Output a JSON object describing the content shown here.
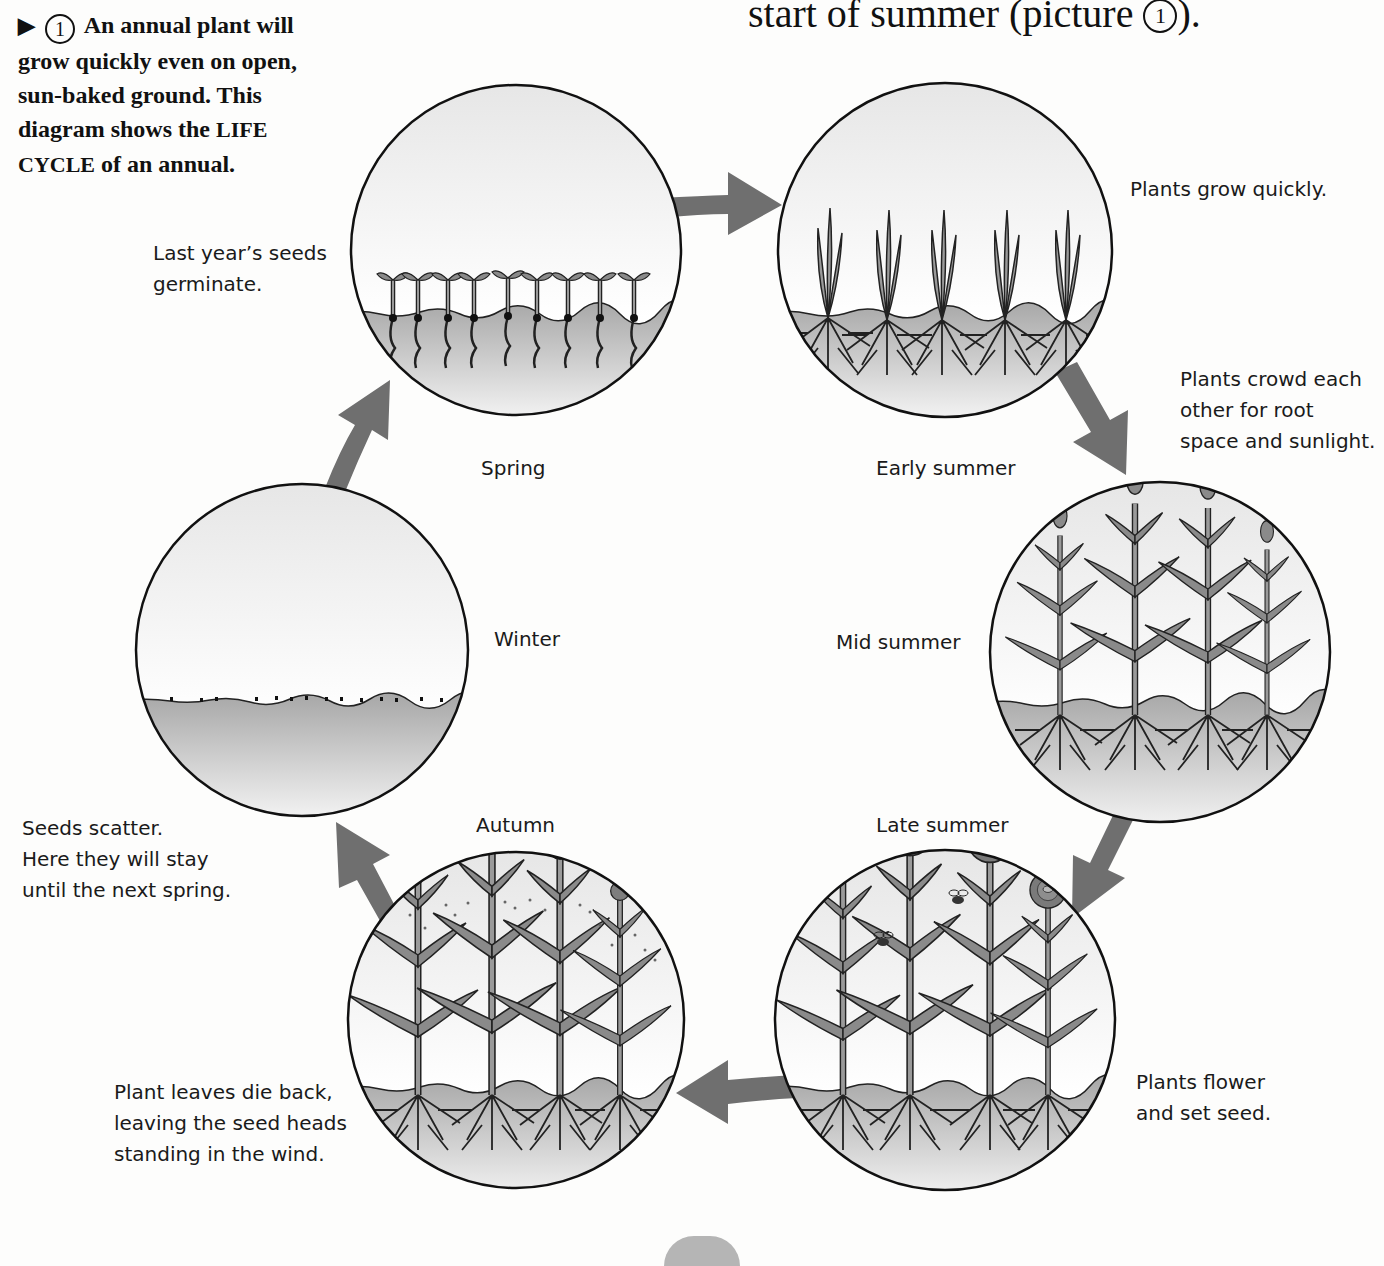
{
  "intro": {
    "marker": "▶",
    "number": "1",
    "text_before": "An annual plant will grow quickly even on open, sun-baked ground. This diagram shows the",
    "term": "LIFE CYCLE",
    "text_after": "of an annual."
  },
  "heading_fragment": {
    "text": "start of summer (picture",
    "number": "1",
    "suffix": ")."
  },
  "stages": [
    {
      "id": "spring",
      "label": "Spring",
      "caption": [
        "Last year’s seeds",
        "germinate."
      ]
    },
    {
      "id": "early-summer",
      "label": "Early summer",
      "caption": [
        "Plants grow quickly."
      ]
    },
    {
      "id": "mid-summer",
      "label": "Mid summer",
      "caption": [
        "Plants crowd each",
        "other for root",
        "space and sunlight."
      ]
    },
    {
      "id": "late-summer",
      "label": "Late summer",
      "caption": [
        "Plants flower",
        "and set seed."
      ]
    },
    {
      "id": "autumn",
      "label": "Autumn",
      "caption": [
        "Plant leaves die back,",
        "leaving the seed heads",
        "standing in the wind."
      ]
    },
    {
      "id": "winter",
      "label": "Winter",
      "caption": [
        "Seeds scatter.",
        "Here they will stay",
        "until the next spring."
      ]
    }
  ],
  "colors": {
    "arrow": "#6f6f6f",
    "soil": "#a9a9a9",
    "plant": "#8a8a8a",
    "outline": "#111111",
    "sky": "#f2f2f2"
  }
}
